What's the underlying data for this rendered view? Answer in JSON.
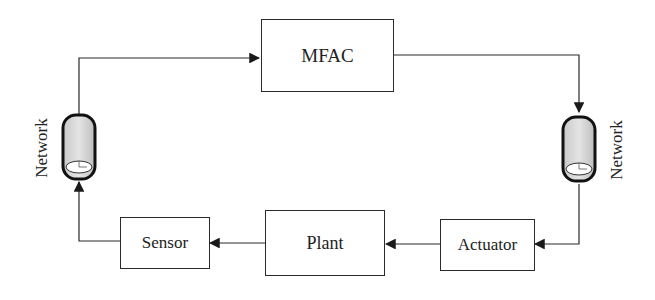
{
  "diagram": {
    "type": "control-loop-block-diagram",
    "blocks": {
      "controller": {
        "label": "MFAC"
      },
      "plant": {
        "label": "Plant"
      },
      "sensor": {
        "label": "Sensor"
      },
      "actuator": {
        "label": "Actuator"
      }
    },
    "network_left": {
      "label": "Network"
    },
    "network_right": {
      "label": "Network"
    },
    "flow": [
      "Sensor -> Network (left) -> MFAC",
      "MFAC -> Network (right) -> Actuator",
      "Actuator -> Plant -> Sensor"
    ],
    "colors": {
      "line": "#2a2a2a",
      "cylinder_fill": "#d8d8d8",
      "background": "#ffffff"
    }
  }
}
